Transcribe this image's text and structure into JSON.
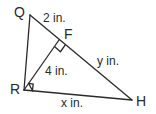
{
  "diagram": {
    "type": "right-triangle-with-altitude",
    "line_color": "#2a2a2a",
    "vertices": [
      {
        "id": "Q",
        "label": "Q",
        "x": 30,
        "y": 15
      },
      {
        "id": "R",
        "label": "R",
        "x": 24,
        "y": 90
      },
      {
        "id": "H",
        "label": "H",
        "x": 132,
        "y": 100
      },
      {
        "id": "F",
        "label": "F",
        "x": 59,
        "y": 40
      }
    ],
    "segments": [
      {
        "from": "Q",
        "to": "R"
      },
      {
        "from": "R",
        "to": "H"
      },
      {
        "from": "Q",
        "to": "H"
      },
      {
        "from": "R",
        "to": "F"
      }
    ],
    "right_angles": [
      "R",
      "F"
    ],
    "measures": {
      "QF": "2 in.",
      "RF": "4 in.",
      "FH": "y in.",
      "RH": "x in."
    }
  }
}
